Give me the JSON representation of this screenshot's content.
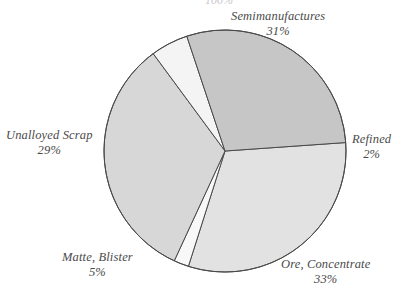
{
  "chart_data": {
    "type": "pie",
    "title": "",
    "title_fragment": "100%",
    "categories": [
      "Ore, Concentrate",
      "Matte, Blister",
      "Unalloyed Scrap",
      "Semimanufactures",
      "Refined"
    ],
    "values": [
      33,
      5,
      29,
      31,
      2
    ],
    "value_suffix": "%",
    "legend_position": "outside-labels",
    "grid": false,
    "slices": [
      {
        "label": "Semimanufactures",
        "value": "31%",
        "value_number": 31,
        "color": "#e2e2e2",
        "label_id": "label-semimanufactures"
      },
      {
        "label": "Refined",
        "value": "2%",
        "value_number": 2,
        "color": "#f8f8f8",
        "label_id": "label-refined"
      },
      {
        "label": "Ore, Concentrate",
        "value": "33%",
        "value_number": 33,
        "color": "#d7d7d7",
        "label_id": "label-ore"
      },
      {
        "label": "Matte, Blister",
        "value": "5%",
        "value_number": 5,
        "color": "#f4f4f4",
        "label_id": "label-matte"
      },
      {
        "label": "Unalloyed Scrap",
        "value": "29%",
        "value_number": 29,
        "color": "#c6c6c6",
        "label_id": "label-unalloyed"
      }
    ],
    "geometry": {
      "center_x": 225,
      "center_y": 151,
      "radius": 121,
      "start_angle_deg": -4
    },
    "style": {
      "stroke": "#4a4a4a",
      "stroke_width": 1,
      "background": "#ffffff",
      "label_color": "#4a4a4a"
    }
  },
  "labels": {
    "semimanufactures": {
      "name": "Semimanufactures",
      "value": "31%"
    },
    "refined": {
      "name": "Refined",
      "value": "2%"
    },
    "ore": {
      "name": "Ore, Concentrate",
      "value": "33%"
    },
    "matte": {
      "name": "Matte, Blister",
      "value": "5%"
    },
    "unalloyed": {
      "name": "Unalloyed Scrap",
      "value": "29%"
    }
  },
  "title_fragment": "100%"
}
